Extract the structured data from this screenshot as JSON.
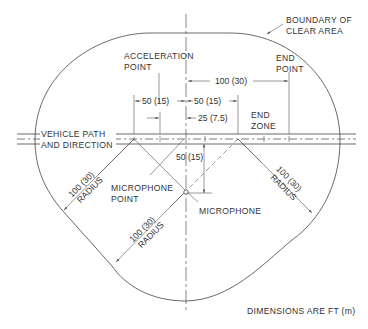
{
  "diagram": {
    "labels": {
      "boundary_line1": "BOUNDARY OF",
      "boundary_line2": "CLEAR AREA",
      "accel_line1": "ACCELERATION",
      "accel_line2": "POINT",
      "end_point_line1": "END",
      "end_point_line2": "POINT",
      "end_zone_line1": "END",
      "end_zone_line2": "ZONE",
      "vehicle_line1": "VEHICLE PATH",
      "vehicle_line2": "AND DIRECTION",
      "mic_point_line1": "MICROPHONE",
      "mic_point_line2": "POINT",
      "microphone": "MICROPHONE",
      "units_note": "DIMENSIONS ARE FT (m)"
    },
    "dimensions": {
      "to_end_point": "100 (30)",
      "accel_zone_left": "50 (15)",
      "accel_zone_right": "50 (15)",
      "quarter_offset": "25 (7.5)",
      "mic_offset": "50 (15)",
      "radius_upper_left_value": "100 (30)",
      "radius_upper_left_word": "RADIUS",
      "radius_lower_left_value": "100 (30)",
      "radius_lower_left_word": "RADIUS",
      "radius_right_value": "100 (30)",
      "radius_right_word": "RADIUS"
    },
    "colors": {
      "line": "#444444",
      "text": "#333333",
      "background": "#ffffff"
    }
  }
}
